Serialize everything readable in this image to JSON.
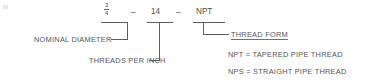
{
  "diagram": {
    "designation": {
      "nominal_diameter": {
        "numerator": "3",
        "denominator": "4"
      },
      "separator_1": "–",
      "threads_per_inch": "14",
      "separator_2": "–",
      "thread_form": "NPT"
    },
    "callout_labels": {
      "nominal_diameter": "NOMINAL DIAMETER",
      "threads_per_inch": "THREADS PER INCH",
      "thread_form": "THREAD FORM"
    },
    "legend": [
      {
        "code": "NPT",
        "equals": "=",
        "meaning": "TAPERED PIPE THREAD",
        "text": "NPT  =  TAPERED PIPE THREAD"
      },
      {
        "code": "NPS",
        "equals": "=",
        "meaning": "STRAIGHT PIPE THREAD",
        "text": "NPS  =  STRAIGHT PIPE THREAD"
      }
    ],
    "colors": {
      "background": "#ffffff",
      "text": "#555555",
      "leader_line": "#5e5e5e"
    }
  }
}
